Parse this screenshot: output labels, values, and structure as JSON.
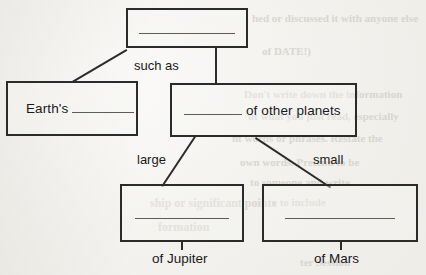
{
  "diagram": {
    "type": "concept-map-worksheet",
    "nodes": [
      {
        "id": "root",
        "label": "",
        "blank_prefix": "",
        "blank_suffix": "",
        "has_blank": true,
        "blank_width": 96
      },
      {
        "id": "earths",
        "label": "Earth's",
        "blank_prefix": "Earth's",
        "blank_suffix": "",
        "has_blank": true,
        "blank_width": 58
      },
      {
        "id": "other-planets",
        "label": "of other planets",
        "blank_prefix": "",
        "blank_suffix": "of other planets",
        "has_blank": true,
        "blank_width": 58
      },
      {
        "id": "jupiter",
        "label": "",
        "blank_prefix": "",
        "blank_suffix": "",
        "has_blank": true,
        "blank_width": 94
      },
      {
        "id": "mars",
        "label": "",
        "blank_prefix": "",
        "blank_suffix": "",
        "has_blank": true,
        "blank_width": 110
      }
    ],
    "edge_labels": {
      "such_as": "such as",
      "large": "large",
      "small": "small"
    },
    "captions": {
      "jupiter": "of Jupiter",
      "mars": "of Mars"
    },
    "colors": {
      "ink": "#2b2b2b",
      "paper": "#f3f2ef",
      "rule": "#5d5c58",
      "ghost": "#c9c7c1"
    }
  },
  "ghost_text": {
    "line1": "hed or discussed it with anyone else",
    "line2": "of DATE!)",
    "line3": "Don't write down the information",
    "line4": "ut what you just read, especially",
    "line5": "nt words or phrases. Restate the",
    "line6": "own words. Pretend to be",
    "line7": "to someone and write",
    "line8": "e to include",
    "line9": "ship or significant points",
    "line10": "formation",
    "line11": "ter Session"
  }
}
